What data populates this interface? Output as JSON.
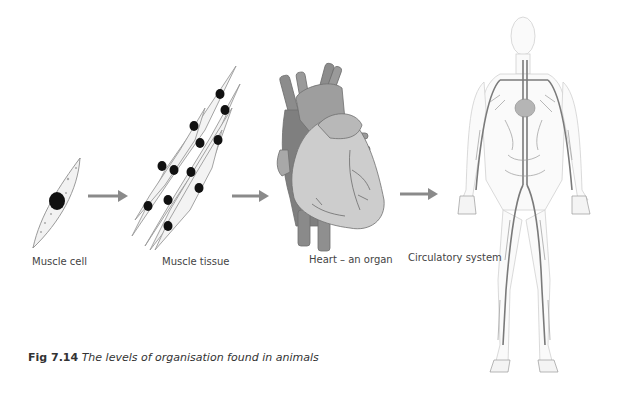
{
  "figure": {
    "caption_number": "Fig 7.14",
    "caption_text": "The levels of organisation found in animals"
  },
  "stages": [
    {
      "label": "Muscle cell",
      "icon": "muscle-cell-icon"
    },
    {
      "label": "Muscle tissue",
      "icon": "muscle-tissue-icon"
    },
    {
      "label": "Heart – an organ",
      "icon": "heart-icon"
    },
    {
      "label": "Circulatory system",
      "icon": "circulatory-system-icon"
    }
  ],
  "arrows": [
    {
      "from": "Muscle cell",
      "to": "Muscle tissue"
    },
    {
      "from": "Muscle tissue",
      "to": "Heart – an organ"
    },
    {
      "from": "Heart – an organ",
      "to": "Circulatory system"
    }
  ],
  "colors": {
    "arrow": "#8a8a8a",
    "cell_outline": "#9a9a9a",
    "nucleus": "#111111",
    "heart_fill": "#c8c8c8",
    "heart_dark": "#8f8f8f",
    "vessel": "#7d7d7d",
    "caption_text": "#333333"
  }
}
